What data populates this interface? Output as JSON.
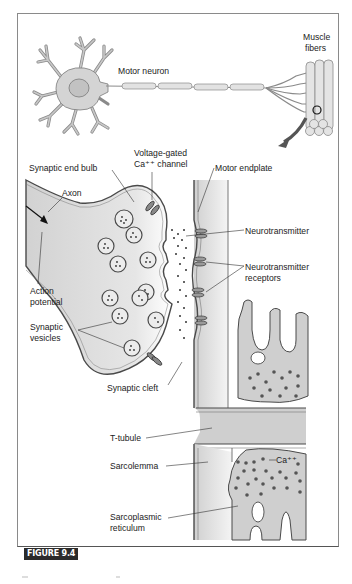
{
  "figure": {
    "label": "FIGURE 9.4",
    "badge_color": "#2b2b2b"
  },
  "overview": {
    "motor_neuron_label": "Motor neuron",
    "muscle_fibers_label_line1": "Muscle",
    "muscle_fibers_label_line2": "fibers"
  },
  "synapse": {
    "synaptic_end_bulb": "Synaptic end bulb",
    "voltage_gated_line1": "Voltage-gated",
    "voltage_gated_line2": "Ca⁺⁺ channel",
    "motor_endplate": "Motor endplate",
    "axon": "Axon",
    "neurotransmitter": "Neurotransmitter",
    "neurotransmitter_receptors_line1": "Neurotransmitter",
    "neurotransmitter_receptors_line2": "receptors",
    "action_potential_line1": "Action",
    "action_potential_line2": "potential",
    "synaptic_vesicles_line1": "Synaptic",
    "synaptic_vesicles_line2": "vesicles",
    "synaptic_cleft": "Synaptic cleft"
  },
  "muscle": {
    "t_tubule": "T-tubule",
    "sarcolemma": "Sarcolemma",
    "calcium": "Ca⁺⁺",
    "sarcoplasmic_line1": "Sarcoplasmic",
    "sarcoplasmic_line2": "reticulum"
  },
  "colors": {
    "fill_gray": "#d8d8d8",
    "outline": "#555555",
    "dot": "#555555"
  }
}
